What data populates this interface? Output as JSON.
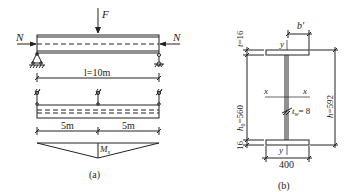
{
  "figure_a": {
    "caption": "(a)",
    "load_label": "F",
    "axial_left": "N",
    "axial_right": "N",
    "span_label": "l=10m",
    "segment_left": "5m",
    "segment_right": "5m",
    "moment_label": "M",
    "moment_sub": "x"
  },
  "figure_b": {
    "caption": "(b)",
    "flange_width_top": "b'",
    "flange_thickness_top": "t=16",
    "web_height_h": "h",
    "web_height_sub": "0",
    "web_height_val": "=560",
    "flange_thickness_bottom": "16",
    "total_height": "h=592",
    "web_thickness_t": "t",
    "web_thickness_sub": "w",
    "web_thickness_val": "= 8",
    "flange_width_bottom": "400",
    "axis_x_left": "x",
    "axis_x_right": "x",
    "axis_y_top": "y",
    "axis_y_bottom": "y"
  },
  "colors": {
    "line": "#222222",
    "background": "#ffffff"
  }
}
